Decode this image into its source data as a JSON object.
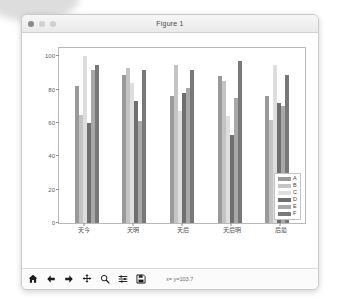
{
  "window": {
    "title": "Figure 1",
    "traffic_lights": [
      "close",
      "minimize",
      "maximize"
    ]
  },
  "toolbar": {
    "buttons": [
      {
        "name": "home-icon",
        "label": "Home"
      },
      {
        "name": "back-arrow-icon",
        "label": "Back"
      },
      {
        "name": "forward-arrow-icon",
        "label": "Forward"
      },
      {
        "name": "pan-move-icon",
        "label": "Pan"
      },
      {
        "name": "magnifier-zoom-icon",
        "label": "Zoom"
      },
      {
        "name": "sliders-configure-icon",
        "label": "Configure subplots"
      },
      {
        "name": "floppy-save-icon",
        "label": "Save"
      }
    ],
    "coordinate_readout": "x=      y=103.7"
  },
  "chart_data": {
    "type": "bar",
    "title": "",
    "xlabel": "",
    "ylabel": "",
    "ylim": [
      0,
      105
    ],
    "yticks": [
      0,
      20,
      40,
      60,
      80,
      100
    ],
    "grid": false,
    "legend_position": "lower right",
    "categories": [
      "今天",
      "明天",
      "后天",
      "明后天",
      "最后"
    ],
    "series": [
      {
        "name": "A",
        "color": "#9a9a9a",
        "values": [
          82,
          89,
          76,
          88,
          76
        ]
      },
      {
        "name": "B",
        "color": "#c4c4c4",
        "values": [
          65,
          93,
          95,
          85,
          62
        ]
      },
      {
        "name": "C",
        "color": "#dedede",
        "values": [
          100,
          84,
          67,
          64,
          95
        ]
      },
      {
        "name": "D",
        "color": "#6f6f6f",
        "values": [
          60,
          73,
          78,
          53,
          72
        ]
      },
      {
        "name": "E",
        "color": "#a8a8a8",
        "values": [
          92,
          61,
          81,
          75,
          70
        ]
      },
      {
        "name": "F",
        "color": "#787878",
        "values": [
          95,
          92,
          92,
          97,
          89
        ]
      }
    ]
  }
}
